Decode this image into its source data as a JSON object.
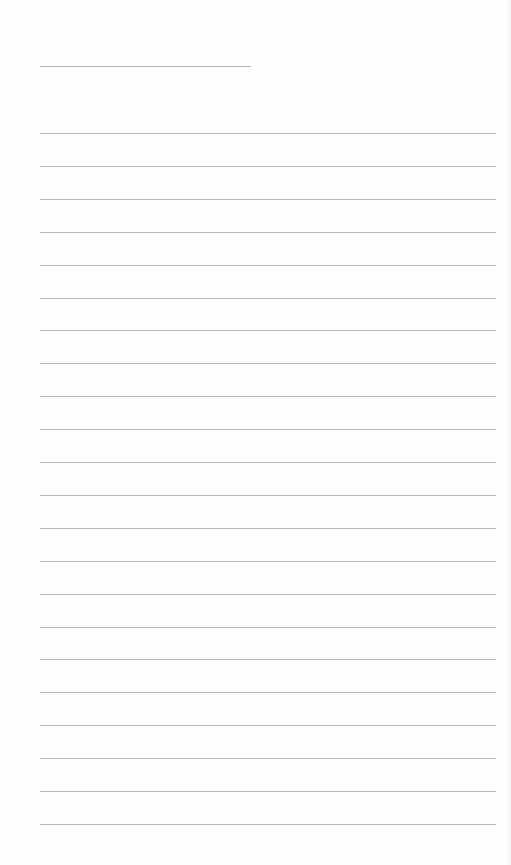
{
  "page": {
    "type": "lined-paper",
    "background_color": "#fefefe",
    "line_color": "#b8b8b8",
    "title_line": {
      "x": 40,
      "y": 66,
      "width": 211
    },
    "rules": {
      "count": 22,
      "start_y": 133,
      "spacing": 32.9,
      "x": 40,
      "width": 456
    }
  }
}
